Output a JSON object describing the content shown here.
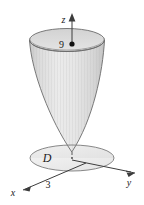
{
  "figure": {
    "type": "3d-math-diagram",
    "background_color": "#ffffff",
    "stroke_color": "#4a4a4a",
    "surface_fill_light": "#e9e9e9",
    "surface_fill_dark": "#c8c8c8",
    "disk_fill": "#ededed",
    "label_color": "#1a1a1a"
  },
  "axes": {
    "z": {
      "label": "z",
      "arrow": "up",
      "solid_from_y": 18,
      "dashed": true
    },
    "x": {
      "label": "x",
      "arrow": "down-left"
    },
    "y": {
      "label": "y",
      "arrow": "right"
    }
  },
  "markers": {
    "z_intercept": {
      "label": "9",
      "dot": true,
      "on_axis": "z"
    },
    "x_intercept": {
      "label": "3",
      "on_axis": "x"
    }
  },
  "regions": {
    "disk": {
      "label": "D",
      "shape": "ellipse"
    }
  }
}
